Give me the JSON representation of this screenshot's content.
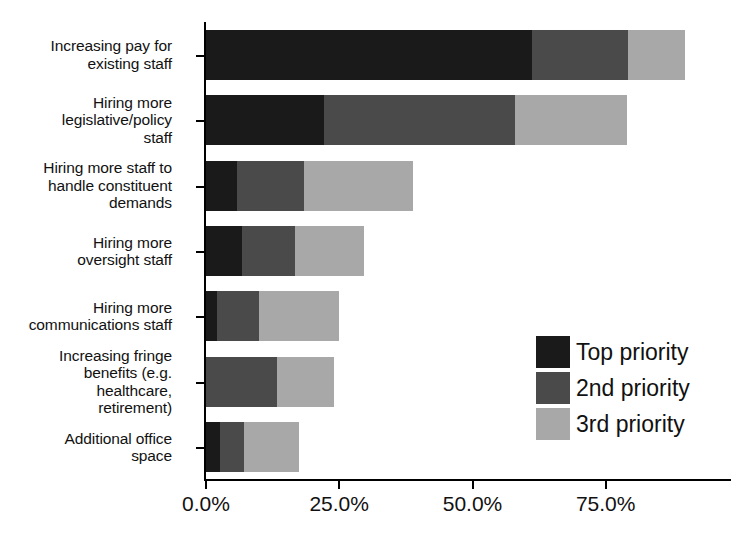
{
  "chart_data": {
    "type": "bar",
    "orientation": "horizontal",
    "stacked": true,
    "title": "",
    "subtitle": "",
    "xlabel": "",
    "ylabel": "",
    "xlim": [
      0,
      98.5
    ],
    "grid": false,
    "legend_position": "middle-right",
    "categories": [
      "Increasing pay for\nexisting staff",
      "Hiring more\nlegislative/policy\nstaff",
      "Hiring more staff to\nhandle constituent\ndemands",
      "Hiring more\noversight staff",
      "Hiring more\ncommunications staff",
      "Increasing fringe\nbenefits (e.g.\nhealthcare,\nretirement)",
      "Additional office\nspace"
    ],
    "series": [
      {
        "name": "Top priority",
        "color": "#1a1a1a",
        "values": [
          61.2,
          22.1,
          5.8,
          6.7,
          2.1,
          0.0,
          2.6
        ]
      },
      {
        "name": "2nd priority",
        "color": "#4a4a4a",
        "values": [
          18.0,
          35.8,
          12.6,
          10.0,
          7.8,
          13.3,
          4.5
        ]
      },
      {
        "name": "3rd priority",
        "color": "#a8a8a8",
        "values": [
          10.7,
          21.1,
          20.4,
          12.9,
          15.0,
          10.7,
          10.3
        ]
      }
    ],
    "totals": [
      89.9,
      79.0,
      38.8,
      29.6,
      24.9,
      24.0,
      17.4
    ],
    "xticks": [
      0,
      25,
      50,
      75
    ],
    "xticklabels": [
      "0.0%",
      "25.0%",
      "50.0%",
      "75.0%"
    ]
  },
  "legend": {
    "entries": [
      {
        "label": "Top priority",
        "color": "#1a1a1a"
      },
      {
        "label": "2nd priority",
        "color": "#4a4a4a"
      },
      {
        "label": "3rd priority",
        "color": "#a8a8a8"
      }
    ]
  },
  "colors": {
    "top_priority": "#1a1a1a",
    "second_priority": "#4a4a4a",
    "third_priority": "#a8a8a8",
    "axis": "#000000",
    "background": "#ffffff",
    "text": "#111111"
  }
}
